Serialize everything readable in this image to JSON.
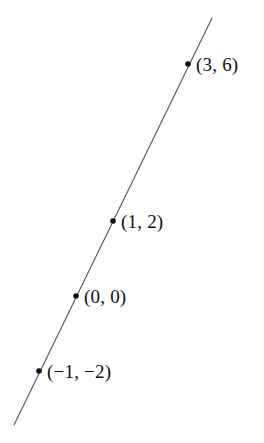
{
  "figure": {
    "background_color": "#ffffff",
    "width": 264,
    "height": 443
  },
  "chart_data": {
    "type": "line",
    "title": "",
    "subtitle": "",
    "xlabel": "",
    "ylabel": "",
    "grid": false,
    "axes_visible": false,
    "legend": null,
    "line_color": "#555555",
    "point_color": "#111111",
    "equation": "y = 2x",
    "slope": 2,
    "intercept": 0,
    "x": [
      -1,
      0,
      1,
      3
    ],
    "y": [
      -2,
      0,
      2,
      6
    ],
    "series": [
      {
        "name": "y = 2x",
        "x": [
          -1,
          0,
          1,
          3
        ],
        "values": [
          -2,
          0,
          2,
          6
        ]
      }
    ],
    "points": [
      {
        "id": "point-3-6",
        "label": "(3, 6)",
        "x": 3,
        "y": 6,
        "px": 188,
        "py": 64,
        "label_px": 196,
        "label_py": 55
      },
      {
        "id": "point-1-2",
        "label": "(1, 2)",
        "x": 1,
        "y": 2,
        "px": 113,
        "py": 221,
        "label_px": 121,
        "label_py": 212
      },
      {
        "id": "point-0-0",
        "label": "(0, 0)",
        "x": 0,
        "y": 0,
        "px": 76,
        "py": 296,
        "label_px": 84,
        "label_py": 287
      },
      {
        "id": "point-neg1-neg2",
        "label": "(−1, −2)",
        "x": -1,
        "y": -2,
        "px": 39,
        "py": 371,
        "label_px": 47,
        "label_py": 362
      }
    ],
    "line_segment": {
      "x1": 212,
      "y1": 18,
      "x2": 14,
      "y2": 425
    },
    "annotations": [
      "(3, 6)",
      "(1, 2)",
      "(0, 0)",
      "(−1, −2)"
    ]
  }
}
